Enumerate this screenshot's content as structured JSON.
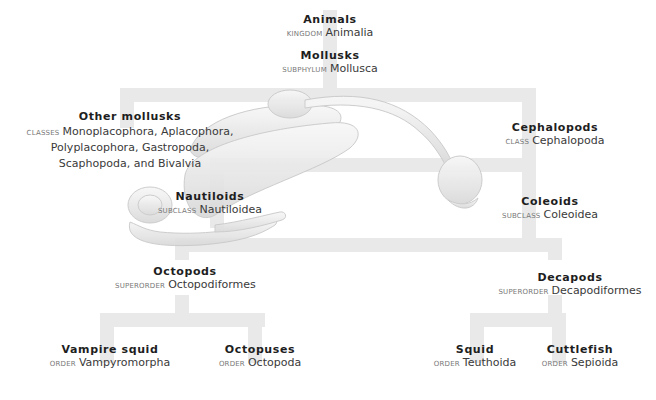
{
  "colors": {
    "tree_bar": "#e9e9e9",
    "illustration_fill": "#ececec",
    "illustration_stroke": "#cfcfcf",
    "common_name_text": "#1e1e1e",
    "scientific_name_text": "#3a3a3a",
    "rank_label_text": "#777777"
  },
  "illustration": "mollusk-anatomy-drawing",
  "nodes": {
    "animals": {
      "common": "Animals",
      "rank": "Kingdom",
      "sci": "Animalia"
    },
    "mollusks": {
      "common": "Mollusks",
      "rank": "Subphylum",
      "sci": "Mollusca"
    },
    "other_mollusks": {
      "common": "Other mollusks",
      "rank": "Classes",
      "sci_line1": "Monoplacophora, Aplacophora,",
      "sci_line2": "Polyplacophora, Gastropoda,",
      "sci_line3": "Scaphopoda, and Bivalvia"
    },
    "cephalopods": {
      "common": "Cephalopods",
      "rank": "Class",
      "sci": "Cephalopoda"
    },
    "nautiloids": {
      "common": "Nautiloids",
      "rank": "Subclass",
      "sci": "Nautiloidea"
    },
    "coleoids": {
      "common": "Coleoids",
      "rank": "Subclass",
      "sci": "Coleoidea"
    },
    "octopods": {
      "common": "Octopods",
      "rank": "Superorder",
      "sci": "Octopodiformes"
    },
    "decapods": {
      "common": "Decapods",
      "rank": "Superorder",
      "sci": "Decapodiformes"
    },
    "vampire_squid": {
      "common": "Vampire squid",
      "rank": "Order",
      "sci": "Vampyromorpha"
    },
    "octopuses": {
      "common": "Octopuses",
      "rank": "Order",
      "sci": "Octopoda"
    },
    "squid": {
      "common": "Squid",
      "rank": "Order",
      "sci": "Teuthoida"
    },
    "cuttlefish": {
      "common": "Cuttlefish",
      "rank": "Order",
      "sci": "Sepioida"
    }
  }
}
